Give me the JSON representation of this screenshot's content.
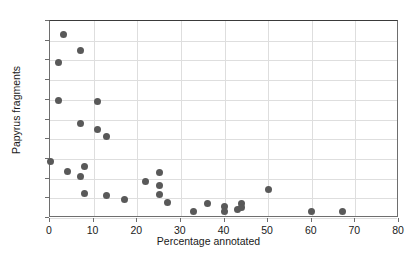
{
  "chart_data": {
    "type": "scatter",
    "title": "",
    "xlabel": "Percentage annotated",
    "ylabel": "Papyrus fragments",
    "xlim": [
      0,
      80
    ],
    "ylim": [
      0,
      200
    ],
    "xticks": [
      0,
      10,
      20,
      30,
      40,
      50,
      60,
      70,
      80
    ],
    "yticks": [
      0,
      20,
      40,
      60,
      80,
      100,
      120,
      140,
      160,
      180,
      200
    ],
    "grid": true,
    "legend": null,
    "marker": {
      "shape": "circle",
      "color": "#595959",
      "size_px": 7
    },
    "series": [
      {
        "name": "fragments",
        "points": [
          [
            0,
            57
          ],
          [
            3,
            186
          ],
          [
            2,
            158
          ],
          [
            7,
            170
          ],
          [
            2,
            119
          ],
          [
            11,
            118
          ],
          [
            7,
            96
          ],
          [
            11,
            90
          ],
          [
            13,
            83
          ],
          [
            4,
            47
          ],
          [
            8,
            52
          ],
          [
            7,
            42
          ],
          [
            8,
            25
          ],
          [
            13,
            23
          ],
          [
            17,
            19
          ],
          [
            22,
            37
          ],
          [
            25,
            46
          ],
          [
            25,
            33
          ],
          [
            25,
            24
          ],
          [
            27,
            16
          ],
          [
            33,
            7
          ],
          [
            36,
            15
          ],
          [
            40,
            12
          ],
          [
            40,
            7
          ],
          [
            43,
            9
          ],
          [
            44,
            15
          ],
          [
            44,
            11
          ],
          [
            50,
            29
          ],
          [
            60,
            7
          ],
          [
            67,
            7
          ]
        ]
      }
    ]
  },
  "colors": {
    "marker": "#595959",
    "gridline": "#dedede",
    "axis": "#6e6e6e",
    "top_border": "#3a3a3a",
    "background": "#ffffff",
    "text": "#1a1a1a"
  }
}
